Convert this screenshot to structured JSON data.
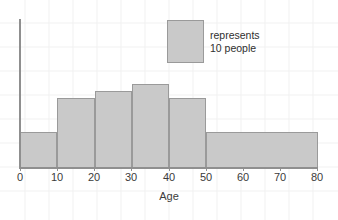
{
  "chart_data": {
    "type": "bar",
    "title": "",
    "subtitle": "",
    "xlabel": "Age",
    "ylabel": "",
    "xlim": [
      0,
      80
    ],
    "ylim": [
      0,
      62
    ],
    "grid": true,
    "bin_edges": [
      0,
      10,
      20,
      30,
      40,
      50,
      80
    ],
    "categories": [
      "0-10",
      "10-20",
      "20-30",
      "30-40",
      "40-50",
      "50-80"
    ],
    "values": [
      15,
      29,
      32,
      35,
      29,
      15
    ],
    "value_unit": "people",
    "xtick_labels": [
      "0",
      "10",
      "20",
      "30",
      "40",
      "50",
      "60",
      "70",
      "80"
    ],
    "xtick_values": [
      0,
      10,
      20,
      30,
      40,
      50,
      60,
      70,
      80
    ],
    "legend": {
      "position": "inside-top-right",
      "swatch_label_line1": "represents",
      "swatch_label_line2": "10 people",
      "swatch_represents_count": 10
    },
    "colors": {
      "bar_fill": "#c9c9c9",
      "bar_stroke": "#9a9a9a",
      "axis": "#8f8f8f",
      "text": "#3b3b3b",
      "grid": "#f0f0f0",
      "background": "#ffffff"
    }
  },
  "axis": {
    "x_title": "Age"
  },
  "legend": {
    "line1": "represents",
    "line2": "10 people"
  }
}
